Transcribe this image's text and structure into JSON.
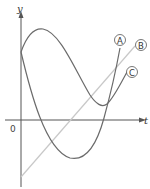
{
  "diagram": {
    "axes": {
      "x_label": "t",
      "y_label": "y",
      "origin_label": "0"
    },
    "curves": [
      {
        "id": "A",
        "label": "A",
        "kind": "cubic",
        "description": "starts on y-axis, dips below t-axis to a minimum, then rises steeply"
      },
      {
        "id": "B",
        "label": "B",
        "kind": "line",
        "description": "straight line with positive slope crossing below origin"
      },
      {
        "id": "C",
        "label": "C",
        "kind": "cubic",
        "description": "starts on y-axis, rises to a maximum, falls to a minimum above t-axis, then rises"
      }
    ],
    "colors": {
      "axis": "#555555",
      "curve_A": "#6b6b6b",
      "curve_B": "#c8c8c8",
      "curve_C": "#6b6b6b"
    }
  }
}
